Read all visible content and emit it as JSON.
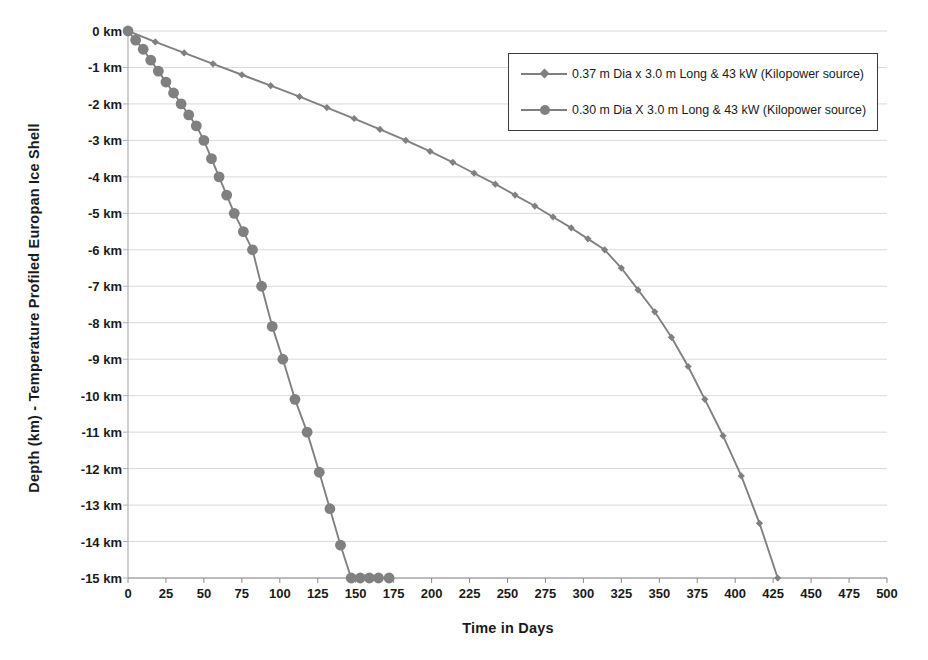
{
  "chart_data": {
    "type": "line",
    "title": "",
    "xlabel": "Time in Days",
    "ylabel": "Depth (km) - Temperature Profiled Europan Ice Shell",
    "xlim": [
      0,
      500
    ],
    "ylim": [
      -15,
      0
    ],
    "xticks": [
      0,
      25,
      50,
      75,
      100,
      125,
      150,
      175,
      200,
      225,
      250,
      275,
      300,
      325,
      350,
      375,
      400,
      425,
      450,
      475,
      500
    ],
    "xtick_labels": [
      "0",
      "25",
      "50",
      "75",
      "100",
      "125",
      "150",
      "175",
      "200",
      "225",
      "250",
      "275",
      "300",
      "325",
      "350",
      "375",
      "400",
      "425",
      "450",
      "475",
      "500"
    ],
    "yticks": [
      0,
      -1,
      -2,
      -3,
      -4,
      -5,
      -6,
      -7,
      -8,
      -9,
      -10,
      -11,
      -12,
      -13,
      -14,
      -15
    ],
    "ytick_labels": [
      "0 km",
      "-1 km",
      "-2 km",
      "-3 km",
      "-4 km",
      "-5 km",
      "-6 km",
      "-7 km",
      "-8 km",
      "-9 km",
      "-10 km",
      "-11 km",
      "-12 km",
      "-13 km",
      "-14 km",
      "-15 km"
    ],
    "grid": "horizontal",
    "legend_position": "upper-right",
    "series_color": "#808080",
    "series": [
      {
        "name": "0.37 m Dia x 3.0 m Long & 43 kW (Kilopower source)",
        "marker": "diamond",
        "color": "#808080",
        "x": [
          0,
          18,
          37,
          56,
          75,
          94,
          113,
          131,
          149,
          166,
          183,
          199,
          214,
          228,
          242,
          255,
          268,
          280,
          292,
          303,
          314,
          325,
          336,
          347,
          358,
          369,
          380,
          392,
          404,
          416,
          428
        ],
        "y": [
          0,
          -0.3,
          -0.6,
          -0.9,
          -1.2,
          -1.5,
          -1.8,
          -2.1,
          -2.4,
          -2.7,
          -3.0,
          -3.3,
          -3.6,
          -3.9,
          -4.2,
          -4.5,
          -4.8,
          -5.1,
          -5.4,
          -5.7,
          -6.0,
          -6.5,
          -7.1,
          -7.7,
          -8.4,
          -9.2,
          -10.1,
          -11.1,
          -12.2,
          -13.5,
          -15.0
        ]
      },
      {
        "name": "0.30 m Dia X 3.0 m Long & 43 kW (Kilopower source)",
        "marker": "circle",
        "color": "#808080",
        "x": [
          0,
          5,
          10,
          15,
          20,
          25,
          30,
          35,
          40,
          45,
          50,
          55,
          60,
          65,
          70,
          76,
          82,
          88,
          95,
          102,
          110,
          118,
          126,
          133,
          140,
          147,
          153,
          159,
          165,
          172
        ],
        "y": [
          0,
          -0.25,
          -0.5,
          -0.8,
          -1.1,
          -1.4,
          -1.7,
          -2.0,
          -2.3,
          -2.6,
          -3.0,
          -3.5,
          -4.0,
          -4.5,
          -5.0,
          -5.5,
          -6.0,
          -7.0,
          -8.1,
          -9.0,
          -10.1,
          -11.0,
          -12.1,
          -13.1,
          -14.1,
          -15.0,
          -15.0,
          -15.0,
          -15.0,
          -15.0
        ]
      }
    ]
  },
  "legend": {
    "entries": [
      {
        "label": "0.37 m Dia x 3.0 m Long & 43 kW (Kilopower source)",
        "marker": "diamond"
      },
      {
        "label": "0.30 m Dia X 3.0 m Long & 43 kW (Kilopower source)",
        "marker": "circle"
      }
    ]
  },
  "axes": {
    "y_title": "Depth (km) - Temperature Profiled Europan Ice Shell",
    "x_title": "Time in Days"
  }
}
